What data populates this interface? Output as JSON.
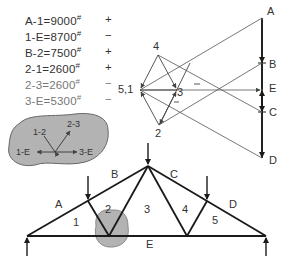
{
  "equations": [
    {
      "member": "A-1",
      "value": "9000",
      "unit": "#",
      "sign": "+"
    },
    {
      "member": "1-E",
      "value": "8700",
      "unit": "#",
      "sign": "−"
    },
    {
      "member": "B-2",
      "value": "7500",
      "unit": "#",
      "sign": "+"
    },
    {
      "member": "2-1",
      "value": "2600",
      "unit": "#",
      "sign": "+"
    },
    {
      "member": "2-3",
      "value": "2600",
      "unit": "#",
      "sign": "−"
    },
    {
      "member": "3-E",
      "value": "5300",
      "unit": "#",
      "sign": "−"
    }
  ],
  "force_polygon": {
    "load_line_labels": [
      "A",
      "B",
      "E",
      "C",
      "D"
    ],
    "node_labels": {
      "n4": "4",
      "n51": "5,1",
      "n3": "3",
      "n2": "2"
    },
    "sign_marks": [
      "−",
      "−"
    ]
  },
  "free_body": {
    "labels": [
      "1-2",
      "2-3",
      "1-E",
      "3-E"
    ]
  },
  "truss": {
    "space_labels": [
      "A",
      "B",
      "C",
      "D",
      "E"
    ],
    "panel_labels": [
      "1",
      "2",
      "3",
      "4",
      "5"
    ]
  },
  "colors": {
    "line": "#1a1a1a",
    "thin_line": "#555555",
    "blob_fill": "#b3b3b3",
    "blob_stroke": "#666666"
  }
}
